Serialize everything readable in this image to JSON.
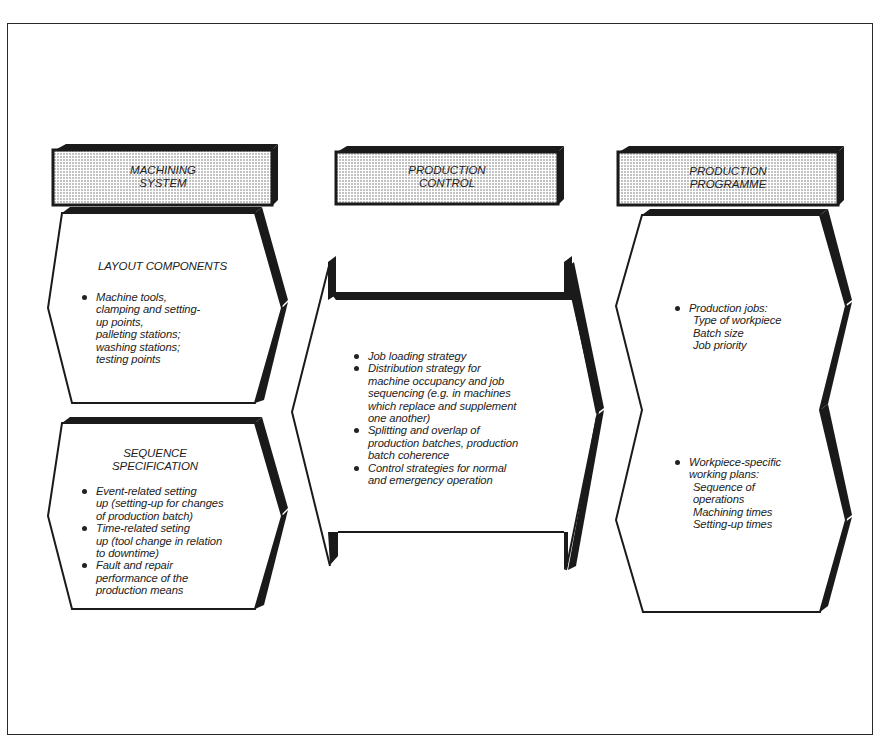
{
  "diagram": {
    "columns": [
      {
        "header": [
          "MACHINING",
          "SYSTEM"
        ],
        "boxes": [
          {
            "title": [
              "LAYOUT COMPONENTS"
            ],
            "items": [
              {
                "lines": [
                  "Machine tools,",
                  "clamping and setting-",
                  "up points,",
                  "palleting stations;",
                  "washing stations;",
                  "testing points"
                ]
              }
            ]
          },
          {
            "title": [
              "SEQUENCE",
              "SPECIFICATION"
            ],
            "items": [
              {
                "lines": [
                  "Event-related setting",
                  "up (setting-up for changes",
                  "of production batch)"
                ]
              },
              {
                "lines": [
                  "Time-related seting",
                  "up (tool change in relation",
                  "to downtime)"
                ]
              },
              {
                "lines": [
                  "Fault and repair",
                  "performance of the",
                  "production means"
                ]
              }
            ]
          }
        ]
      },
      {
        "header": [
          "PRODUCTION",
          "CONTROL"
        ],
        "boxes": [
          {
            "items": [
              {
                "lines": [
                  "Job loading strategy"
                ]
              },
              {
                "lines": [
                  "Distribution strategy for",
                  "machine occupancy and job",
                  "sequencing (e.g. in machines",
                  "which replace and supplement",
                  "one another)"
                ]
              },
              {
                "lines": [
                  "Splitting and overlap of",
                  "production batches, production",
                  "batch coherence"
                ]
              },
              {
                "lines": [
                  "Control strategies for normal",
                  "and emergency operation"
                ]
              }
            ]
          }
        ]
      },
      {
        "header": [
          "PRODUCTION",
          "PROGRAMME"
        ],
        "boxes": [
          {
            "items": [
              {
                "lines": [
                  "Production jobs:"
                ],
                "sub": [
                  "Type of workpiece",
                  "Batch size",
                  "Job priority"
                ]
              },
              {
                "lines": [
                  "Workpiece-specific",
                  "working plans:"
                ],
                "sub": [
                  "Sequence of",
                  "operations",
                  "Machining times",
                  "Setting-up times"
                ]
              }
            ]
          }
        ]
      }
    ]
  },
  "colors": {
    "ink": "#1a1a1a",
    "header_fill": "#d8d8d8",
    "background": "#ffffff"
  }
}
